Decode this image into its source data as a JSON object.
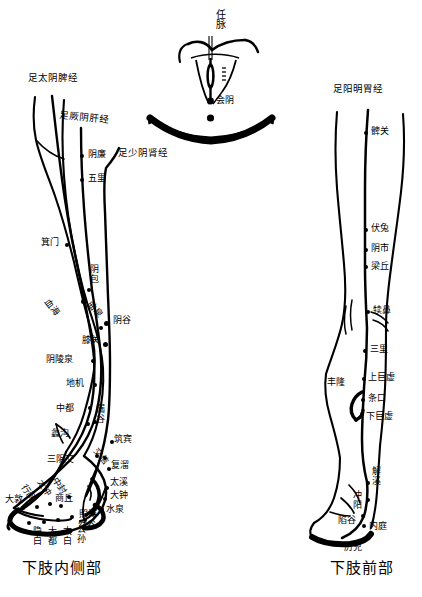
{
  "figure": {
    "title_central": "任脉",
    "central_point": "会阴",
    "captions": [
      {
        "text": "下肢内侧部",
        "x": 22,
        "y": 556
      },
      {
        "text": "下肢前部",
        "x": 330,
        "y": 556
      }
    ],
    "meridian_names": [
      {
        "name": "足太阴脾经",
        "x": 28,
        "y": 78
      },
      {
        "name": "足厥阴肝经",
        "x": 60,
        "y": 114
      },
      {
        "name": "足少阴肾经",
        "x": 118,
        "y": 150
      },
      {
        "name": "足阳明胃经",
        "x": 333,
        "y": 88
      }
    ],
    "left_panel": {
      "name": "下肢内侧部",
      "points": [
        {
          "label": "阴廉",
          "lx": 88,
          "ly": 152,
          "dx": 81,
          "dy": 155
        },
        {
          "label": "五里",
          "lx": 88,
          "ly": 176,
          "dx": 81,
          "dy": 179
        },
        {
          "label": "箕门",
          "lx": 41,
          "ly": 240,
          "dx": 66,
          "dy": 244
        },
        {
          "label": "阴包",
          "lx": 90,
          "ly": 272,
          "dx": 88,
          "dy": 289,
          "vertical": true
        },
        {
          "label": "血海",
          "lx": 50,
          "ly": 303,
          "dx": 82,
          "dy": 300,
          "rotate": -50
        },
        {
          "label": "曲泉",
          "lx": 92,
          "ly": 306,
          "dx": 100,
          "dy": 327,
          "rotate": -50
        },
        {
          "label": "阴谷",
          "lx": 113,
          "ly": 320,
          "dx": 105,
          "dy": 323
        },
        {
          "label": "膝关",
          "lx": 83,
          "ly": 339,
          "dx": 104,
          "dy": 343
        },
        {
          "label": "阴陵泉",
          "lx": 48,
          "ly": 358,
          "dx": 92,
          "dy": 360
        },
        {
          "label": "地机",
          "lx": 68,
          "ly": 382,
          "dx": 94,
          "dy": 384
        },
        {
          "label": "中都",
          "lx": 58,
          "ly": 408,
          "dx": 89,
          "dy": 407
        },
        {
          "label": "漏谷",
          "lx": 96,
          "ly": 408,
          "dx": 94,
          "dy": 421,
          "vertical": false
        },
        {
          "label": "蠡沟",
          "lx": 53,
          "ly": 433,
          "dx": 87,
          "dy": 423
        },
        {
          "label": "筑宾",
          "lx": 115,
          "ly": 438,
          "dx": 111,
          "dy": 441
        },
        {
          "label": "三阴交",
          "lx": 49,
          "ly": 459,
          "dx": 96,
          "dy": 455
        },
        {
          "label": "交信",
          "lx": 97,
          "ly": 452,
          "dx": 104,
          "dy": 457,
          "rotate": -50
        },
        {
          "label": "复溜",
          "lx": 111,
          "ly": 464,
          "dx": 108,
          "dy": 468
        },
        {
          "label": "太溪",
          "lx": 110,
          "ly": 481,
          "dx": 106,
          "dy": 487
        },
        {
          "label": "大钟",
          "lx": 110,
          "ly": 494,
          "dx": 104,
          "dy": 498
        },
        {
          "label": "中封",
          "lx": 57,
          "ly": 481,
          "dx": 68,
          "dy": 496,
          "rotate": -55
        },
        {
          "label": "商丘",
          "lx": 56,
          "ly": 497,
          "dx": 60,
          "dy": 505
        },
        {
          "label": "水泉",
          "lx": 107,
          "ly": 508,
          "dx": 101,
          "dy": 508
        },
        {
          "label": "照海",
          "lx": 79,
          "ly": 513,
          "dx": 92,
          "dy": 513
        },
        {
          "label": "然谷",
          "lx": 78,
          "ly": 524,
          "dx": 84,
          "dy": 519
        },
        {
          "label": "太冲",
          "lx": 41,
          "ly": 483,
          "dx": 49,
          "dy": 503,
          "rotate": -55
        },
        {
          "label": "行间",
          "lx": 26,
          "ly": 487,
          "dx": 36,
          "dy": 506,
          "rotate": -55
        },
        {
          "label": "大敦",
          "lx": 7,
          "ly": 497,
          "dx": 22,
          "dy": 507
        },
        {
          "label": "隐白",
          "lx": 33,
          "ly": 529,
          "dx": 28,
          "dy": 522,
          "vertical": true
        },
        {
          "label": "大都",
          "lx": 48,
          "ly": 529,
          "dx": 43,
          "dy": 521,
          "vertical": true
        },
        {
          "label": "太白",
          "lx": 63,
          "ly": 529,
          "dx": 57,
          "dy": 519,
          "vertical": true
        },
        {
          "label": "公孙",
          "lx": 77,
          "ly": 527,
          "dx": 71,
          "dy": 516,
          "vertical": true
        }
      ]
    },
    "right_panel": {
      "name": "下肢前部",
      "points": [
        {
          "label": "髀关",
          "lx": 371,
          "ly": 129,
          "dx": 365,
          "dy": 132
        },
        {
          "label": "伏兔",
          "lx": 371,
          "ly": 226,
          "dx": 365,
          "dy": 229
        },
        {
          "label": "阴市",
          "lx": 371,
          "ly": 246,
          "dx": 365,
          "dy": 249
        },
        {
          "label": "梁丘",
          "lx": 371,
          "ly": 264,
          "dx": 365,
          "dy": 266
        },
        {
          "label": "犊鼻",
          "lx": 373,
          "ly": 308,
          "dx": 367,
          "dy": 311
        },
        {
          "label": "三里",
          "lx": 370,
          "ly": 347,
          "dx": 364,
          "dy": 350
        },
        {
          "label": "上巨虚",
          "lx": 368,
          "ly": 375,
          "dx": 362,
          "dy": 378
        },
        {
          "label": "丰隆",
          "lx": 329,
          "ly": 380,
          "dx": 360,
          "dy": 393
        },
        {
          "label": "条口",
          "lx": 368,
          "ly": 396,
          "dx": 362,
          "dy": 399
        },
        {
          "label": "下巨虚",
          "lx": 366,
          "ly": 414,
          "dx": 360,
          "dy": 411
        },
        {
          "label": "解溪",
          "lx": 372,
          "ly": 470,
          "dx": 367,
          "dy": 481,
          "vertical": true
        },
        {
          "label": "冲阳",
          "lx": 355,
          "ly": 495,
          "dx": 367,
          "dy": 498,
          "vertical": true
        },
        {
          "label": "陷谷",
          "lx": 340,
          "ly": 519,
          "dx": 362,
          "dy": 515
        },
        {
          "label": "内庭",
          "lx": 370,
          "ly": 525,
          "dx": 363,
          "dy": 525
        },
        {
          "label": "厉兑",
          "lx": 345,
          "ly": 545,
          "dx": 340,
          "dy": 537
        }
      ]
    }
  },
  "colors": {
    "ink": "#000000",
    "paper": "#ffffff"
  }
}
